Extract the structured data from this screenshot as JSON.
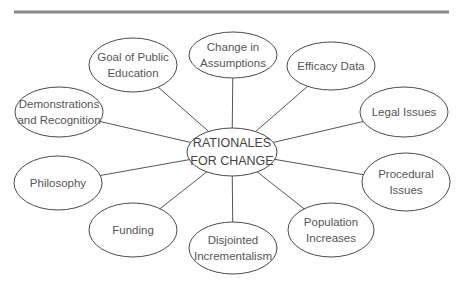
{
  "diagram": {
    "type": "concept-map",
    "center": {
      "id": "center",
      "lines": [
        "RATIONALES",
        "FOR CHANGE"
      ]
    },
    "nodes": [
      {
        "id": "goal-of-public-education",
        "lines": [
          "Goal of Public",
          "Education"
        ]
      },
      {
        "id": "change-in-assumptions",
        "lines": [
          "Change in",
          "Assumptions"
        ]
      },
      {
        "id": "efficacy-data",
        "lines": [
          "Efficacy Data"
        ]
      },
      {
        "id": "legal-issues",
        "lines": [
          "Legal Issues"
        ]
      },
      {
        "id": "procedural-issues",
        "lines": [
          "Procedural",
          "Issues"
        ]
      },
      {
        "id": "population-increases",
        "lines": [
          "Population",
          "Increases"
        ]
      },
      {
        "id": "disjointed-incrementalism",
        "lines": [
          "Disjointed",
          "Incrementalism"
        ]
      },
      {
        "id": "funding",
        "lines": [
          "Funding"
        ]
      },
      {
        "id": "philosophy",
        "lines": [
          "Philosophy"
        ]
      },
      {
        "id": "demonstrations-and-recognition",
        "lines": [
          "Demonstrations",
          "and Recognition"
        ]
      }
    ],
    "colors": {
      "rule": "#8a8a8a",
      "stroke": "#4a4a4a",
      "text": "#555555"
    }
  }
}
